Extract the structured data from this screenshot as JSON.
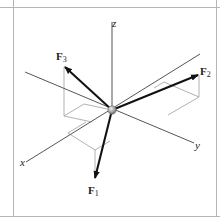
{
  "figure": {
    "type": "3d-force-vector-diagram",
    "axes": {
      "x": {
        "label": "x"
      },
      "y": {
        "label": "y"
      },
      "z": {
        "label": "z"
      }
    },
    "forces": [
      {
        "name": "F",
        "subscript": "1"
      },
      {
        "name": "F",
        "subscript": "2"
      },
      {
        "name": "F",
        "subscript": "3"
      }
    ],
    "colors": {
      "frame": "#b0b0b0",
      "axis": "#555555",
      "construction": "#a8a8a8",
      "vector": "#111111",
      "particle": "#9a9a9a"
    }
  }
}
